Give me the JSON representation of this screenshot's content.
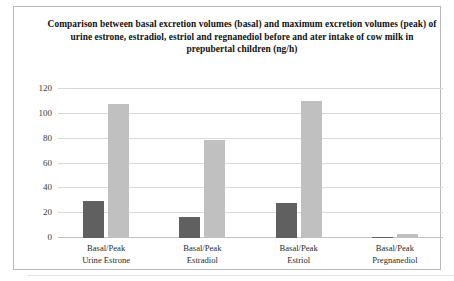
{
  "figure": {
    "background": "#ffffff",
    "frame_color": "#b9b9b9"
  },
  "chart_data": {
    "type": "bar",
    "title_lines": [
      "Comparison between basal excretion volumes (basal) and maximum excretion",
      "volumes (peak) of urine estrone, estradiol, estriol and regnanediol before and",
      "ater intake of cow milk in prepubertal children (ng/h)"
    ],
    "xlabel": "",
    "ylabel": "",
    "ylim": [
      0,
      120
    ],
    "yticks": [
      0,
      20,
      40,
      60,
      80,
      100,
      120
    ],
    "ytick_labels": [
      "0",
      "20",
      "40",
      "60",
      "80",
      "100",
      "120"
    ],
    "grid": true,
    "legend": false,
    "categories": [
      {
        "line1": "Basal/Peak",
        "line2": "Urine Estrone"
      },
      {
        "line1": "Basal/Peak",
        "line2": "Estradiol"
      },
      {
        "line1": "Basal/Peak",
        "line2": "Estriol"
      },
      {
        "line1": "Basal/Peak",
        "line2": "Pregnanediol"
      }
    ],
    "category_labels": [
      "Basal/Peak Urine Estrone",
      "Basal/Peak Estradiol",
      "Basal/Peak Estriol",
      "Basal/Peak Pregnanediol"
    ],
    "series": [
      {
        "name": "basal",
        "color": "#606060",
        "values": [
          30,
          17,
          28,
          0.6
        ]
      },
      {
        "name": "peak",
        "color": "#c0c0c0",
        "values": [
          108,
          79,
          110,
          3
        ]
      }
    ]
  }
}
